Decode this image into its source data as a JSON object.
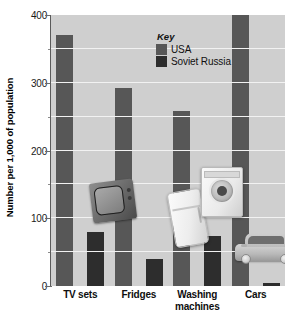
{
  "chart_data": {
    "type": "bar",
    "title": "",
    "subtitle": "",
    "xlabel": "",
    "ylabel": "Number per 1,000 of population",
    "ylim": [
      0,
      400
    ],
    "yticks": [
      0,
      100,
      200,
      300,
      400
    ],
    "ytick_labels": [
      "0",
      "100",
      "200",
      "300",
      "400"
    ],
    "yminor_ticks": [
      50,
      150,
      250,
      350
    ],
    "grid": true,
    "grid_axis": "y",
    "legend_position": "upper-center-inside",
    "categories": [
      "TV sets",
      "Fridges",
      "Washing machines",
      "Cars"
    ],
    "series": [
      {
        "name": "USA",
        "color": "#575757",
        "values": [
          370,
          293,
          258,
          405
        ]
      },
      {
        "name": "Soviet Russia",
        "color": "#2d2d2d",
        "values": [
          80,
          40,
          74,
          5
        ]
      }
    ],
    "annotations": [
      {
        "name": "tv-illustration",
        "category": "TV sets"
      },
      {
        "name": "fridge-illustration",
        "category": "Fridges"
      },
      {
        "name": "washing-machine-illustration",
        "category": "Washing machines"
      },
      {
        "name": "car-illustration",
        "category": "Cars"
      }
    ]
  },
  "legend": {
    "title": "Key",
    "entries": [
      {
        "label": "USA",
        "color": "#575757"
      },
      {
        "label": "Soviet Russia",
        "color": "#2d2d2d"
      }
    ]
  },
  "axis": {
    "y_title": "Number per 1,000 of population"
  },
  "xtick_labels": [
    {
      "line1": "TV sets",
      "line2": ""
    },
    {
      "line1": "Fridges",
      "line2": ""
    },
    {
      "line1": "Washing",
      "line2": "machines"
    },
    {
      "line1": "Cars",
      "line2": ""
    }
  ]
}
